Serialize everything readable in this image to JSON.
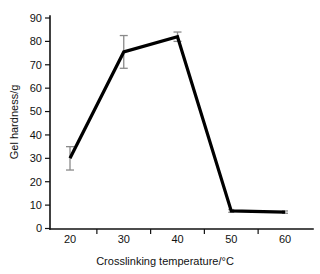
{
  "chart_data": {
    "type": "line",
    "title": "",
    "xlabel": "Crosslinking temperature/°C",
    "ylabel": "Gel hardness/g",
    "x": [
      20,
      30,
      40,
      50,
      60
    ],
    "values": [
      30,
      75.5,
      82,
      7.5,
      7
    ],
    "series": [
      {
        "name": "Gel hardness",
        "values": [
          30,
          75.5,
          82,
          7.5,
          7
        ],
        "errors": [
          5,
          7,
          2,
          0.6,
          0.5
        ]
      }
    ],
    "xlim": [
      15,
      65
    ],
    "ylim": [
      0,
      90
    ],
    "xticks": [
      20,
      30,
      40,
      50,
      60
    ],
    "yticks": [
      0,
      10,
      20,
      30,
      40,
      50,
      60,
      70,
      80,
      90
    ],
    "xtick_labels": [
      "20",
      "30",
      "40",
      "50",
      "60"
    ],
    "ytick_labels": [
      "0",
      "10",
      "20",
      "30",
      "40",
      "50",
      "60",
      "70",
      "80",
      "90"
    ],
    "grid": false,
    "legend": false,
    "legend_position": "none",
    "line_color": "#000000",
    "error_bar_color": "#8a8a8a",
    "background_color": "#ffffff"
  },
  "axes": {
    "y_title": "Gel hardness/g",
    "x_title": "Crosslinking temperature/°C",
    "y_ticks": [
      "90",
      "80",
      "70",
      "60",
      "50",
      "40",
      "30",
      "20",
      "10",
      "0"
    ],
    "x_ticks": [
      "20",
      "30",
      "40",
      "50",
      "60"
    ]
  }
}
